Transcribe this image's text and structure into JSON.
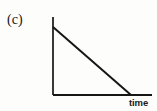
{
  "figure": {
    "panel_label": "(c)",
    "background_color": "#fdfdfc",
    "ink_color": "#161616"
  },
  "chart_data": {
    "type": "line",
    "title": "",
    "subtitle": "",
    "panel_label": "(c)",
    "xlabel": "time",
    "ylabel": "height above ground",
    "x_tick_labels": [],
    "y_tick_labels": [],
    "grid": false,
    "legend": null,
    "axes": {
      "x_axis_visible": true,
      "y_axis_visible": true,
      "arrowheads": false,
      "origin_px": [
        53,
        95
      ],
      "x_axis_end_px": [
        152,
        95
      ],
      "y_axis_top_px": [
        53,
        17
      ]
    },
    "xlim": [
      0,
      1
    ],
    "ylim": [
      0,
      1
    ],
    "series": [
      {
        "name": "height above ground vs time",
        "description": "straight line decreasing at a constant rate from a positive initial height to zero",
        "x": [
          0,
          1
        ],
        "values": [
          0.87,
          0
        ],
        "points_px": [
          [
            53,
            27
          ],
          [
            131,
            95
          ]
        ],
        "line_color": "#161616",
        "line_width_px": 2,
        "style": "solid"
      }
    ],
    "annotations": []
  }
}
